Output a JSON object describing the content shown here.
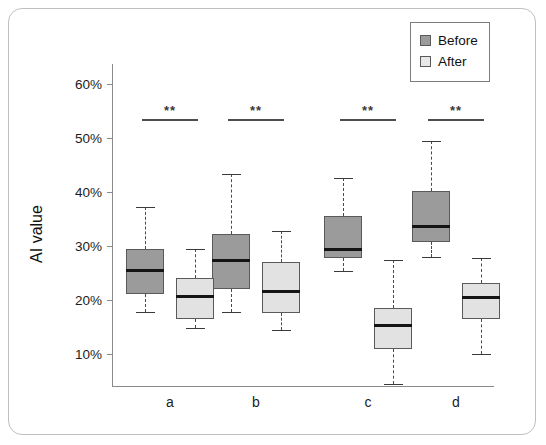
{
  "chart_data": {
    "type": "box",
    "title": "",
    "xlabel": "",
    "ylabel": "AI value",
    "categories": [
      "a",
      "b",
      "c",
      "d"
    ],
    "ylim": [
      3,
      62
    ],
    "ytick_labels": [
      "60%",
      "50%",
      "40%",
      "30%",
      "20%",
      "10%"
    ],
    "ytick_values": [
      60,
      50,
      40,
      30,
      20,
      10
    ],
    "grid": false,
    "legend_position": "top-right",
    "series": [
      {
        "name": "Before",
        "color": "#9b9b9b",
        "boxes": [
          {
            "category": "a",
            "whisker_low": 17.8,
            "q1": 21.1,
            "median": 25.4,
            "q3": 29.4,
            "whisker_high": 37.2
          },
          {
            "category": "b",
            "whisker_low": 17.8,
            "q1": 22.0,
            "median": 27.4,
            "q3": 32.2,
            "whisker_high": 43.3
          },
          {
            "category": "c",
            "whisker_low": 25.4,
            "q1": 27.8,
            "median": 29.4,
            "q3": 35.6,
            "whisker_high": 42.6
          },
          {
            "category": "d",
            "whisker_low": 27.9,
            "q1": 30.7,
            "median": 33.7,
            "q3": 40.2,
            "whisker_high": 49.4
          }
        ]
      },
      {
        "name": "After",
        "color": "#e2e2e2",
        "boxes": [
          {
            "category": "a",
            "whisker_low": 14.8,
            "q1": 16.5,
            "median": 20.6,
            "q3": 24.1,
            "whisker_high": 29.4
          },
          {
            "category": "b",
            "whisker_low": 14.4,
            "q1": 17.6,
            "median": 21.5,
            "q3": 27.0,
            "whisker_high": 32.8
          },
          {
            "category": "c",
            "whisker_low": 4.4,
            "q1": 10.9,
            "median": 15.2,
            "q3": 18.5,
            "whisker_high": 27.4
          },
          {
            "category": "d",
            "whisker_low": 10.0,
            "q1": 16.5,
            "median": 20.4,
            "q3": 23.1,
            "whisker_high": 27.8
          }
        ]
      }
    ],
    "annotations": [
      {
        "category": "a",
        "text": "**",
        "y": 53.5
      },
      {
        "category": "b",
        "text": "**",
        "y": 53.5
      },
      {
        "category": "c",
        "text": "**",
        "y": 53.5
      },
      {
        "category": "d",
        "text": "**",
        "y": 53.5
      }
    ]
  },
  "legend": {
    "items": [
      {
        "label": "Before",
        "swatch": "before"
      },
      {
        "label": "After",
        "swatch": "after"
      }
    ]
  },
  "axes": {
    "y_title": "AI value"
  }
}
